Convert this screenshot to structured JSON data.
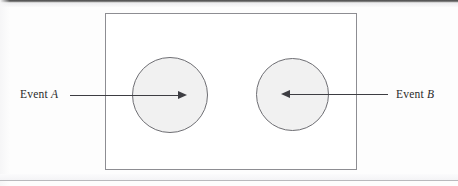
{
  "figure": {
    "type": "venn-diagram",
    "colors": {
      "page_background": "#fdfdfd",
      "rectangle_border": "#8d8d92",
      "circle_fill": "#f1f1f1",
      "circle_border": "#6e6e73",
      "arrow": "#3d3d42",
      "label_text": "#2a2a2a"
    },
    "universe": {
      "name": "sample-space-rectangle",
      "x": 105,
      "y": 13,
      "width": 252,
      "height": 157
    },
    "events": [
      {
        "id": "a",
        "label_prefix": "Event ",
        "label_variable": "A",
        "label_full": "Event A",
        "arrow_direction": "right",
        "circle": {
          "cx": 170,
          "cy": 95,
          "r": 38
        }
      },
      {
        "id": "b",
        "label_prefix": "Event ",
        "label_variable": "B",
        "label_full": "Event B",
        "arrow_direction": "left",
        "circle": {
          "cx": 292,
          "cy": 94,
          "r": 36
        }
      }
    ]
  }
}
